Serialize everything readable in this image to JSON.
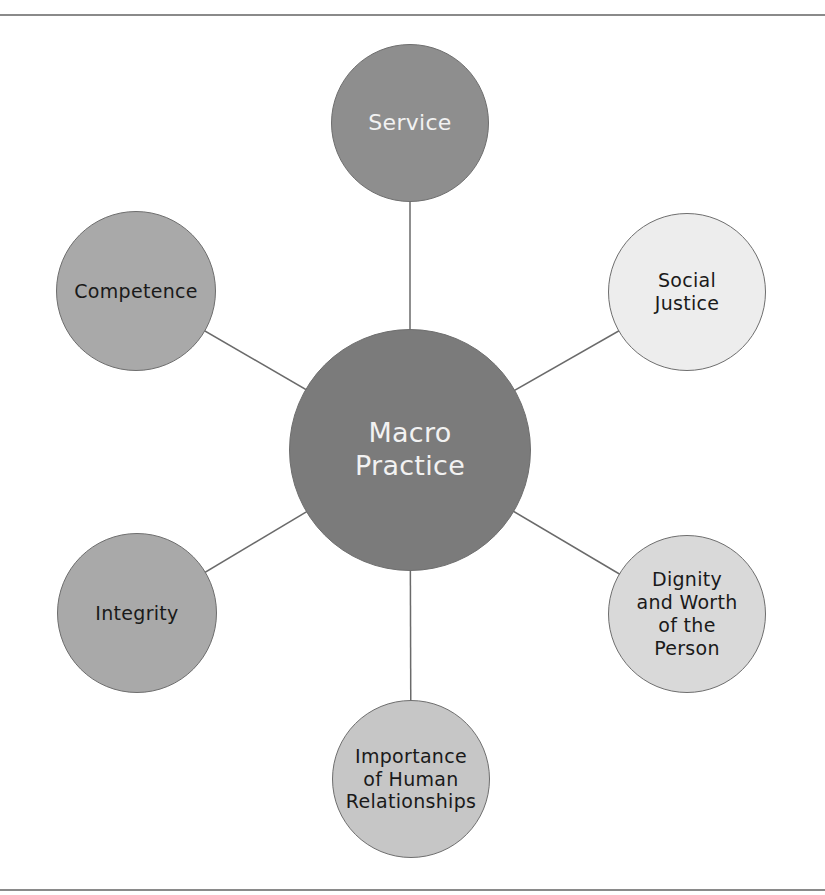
{
  "diagram": {
    "center": {
      "id": "macro-practice",
      "label_lines": [
        "Macro",
        "Practice"
      ],
      "fill": "#7b7b7b",
      "text_color": "#f2f2f2",
      "cx": 410,
      "cy": 450,
      "r": 121
    },
    "nodes": [
      {
        "id": "service",
        "label_lines": [
          "Service"
        ],
        "fill": "#8e8e8e",
        "text_color": "#f2f2f2",
        "cx": 410,
        "cy": 123,
        "r": 79
      },
      {
        "id": "social-justice",
        "label_lines": [
          "Social",
          "Justice"
        ],
        "fill": "#ededed",
        "text_color": "#1a1a1a",
        "cx": 687,
        "cy": 292,
        "r": 79
      },
      {
        "id": "dignity-and-worth",
        "label_lines": [
          "Dignity",
          "and Worth",
          "of the",
          "Person"
        ],
        "fill": "#d9d9d9",
        "text_color": "#1a1a1a",
        "cx": 687,
        "cy": 614,
        "r": 79
      },
      {
        "id": "importance-of-human-relationships",
        "label_lines": [
          "Importance",
          "of Human",
          "Relationships"
        ],
        "fill": "#c6c6c6",
        "text_color": "#1a1a1a",
        "cx": 411,
        "cy": 779,
        "r": 79
      },
      {
        "id": "integrity",
        "label_lines": [
          "Integrity"
        ],
        "fill": "#a9a9a9",
        "text_color": "#1a1a1a",
        "cx": 137,
        "cy": 613,
        "r": 80
      },
      {
        "id": "competence",
        "label_lines": [
          "Competence"
        ],
        "fill": "#a9a9a9",
        "text_color": "#1a1a1a",
        "cx": 136,
        "cy": 291,
        "r": 80
      }
    ],
    "line_color": "#6a6a6a",
    "border_color": "#6e6e6e"
  },
  "labels": {
    "center": "Macro Practice",
    "service": "Service",
    "social_justice": "Social Justice",
    "dignity": "Dignity and Worth of the Person",
    "importance": "Importance of Human Relationships",
    "integrity": "Integrity",
    "competence": "Competence"
  }
}
